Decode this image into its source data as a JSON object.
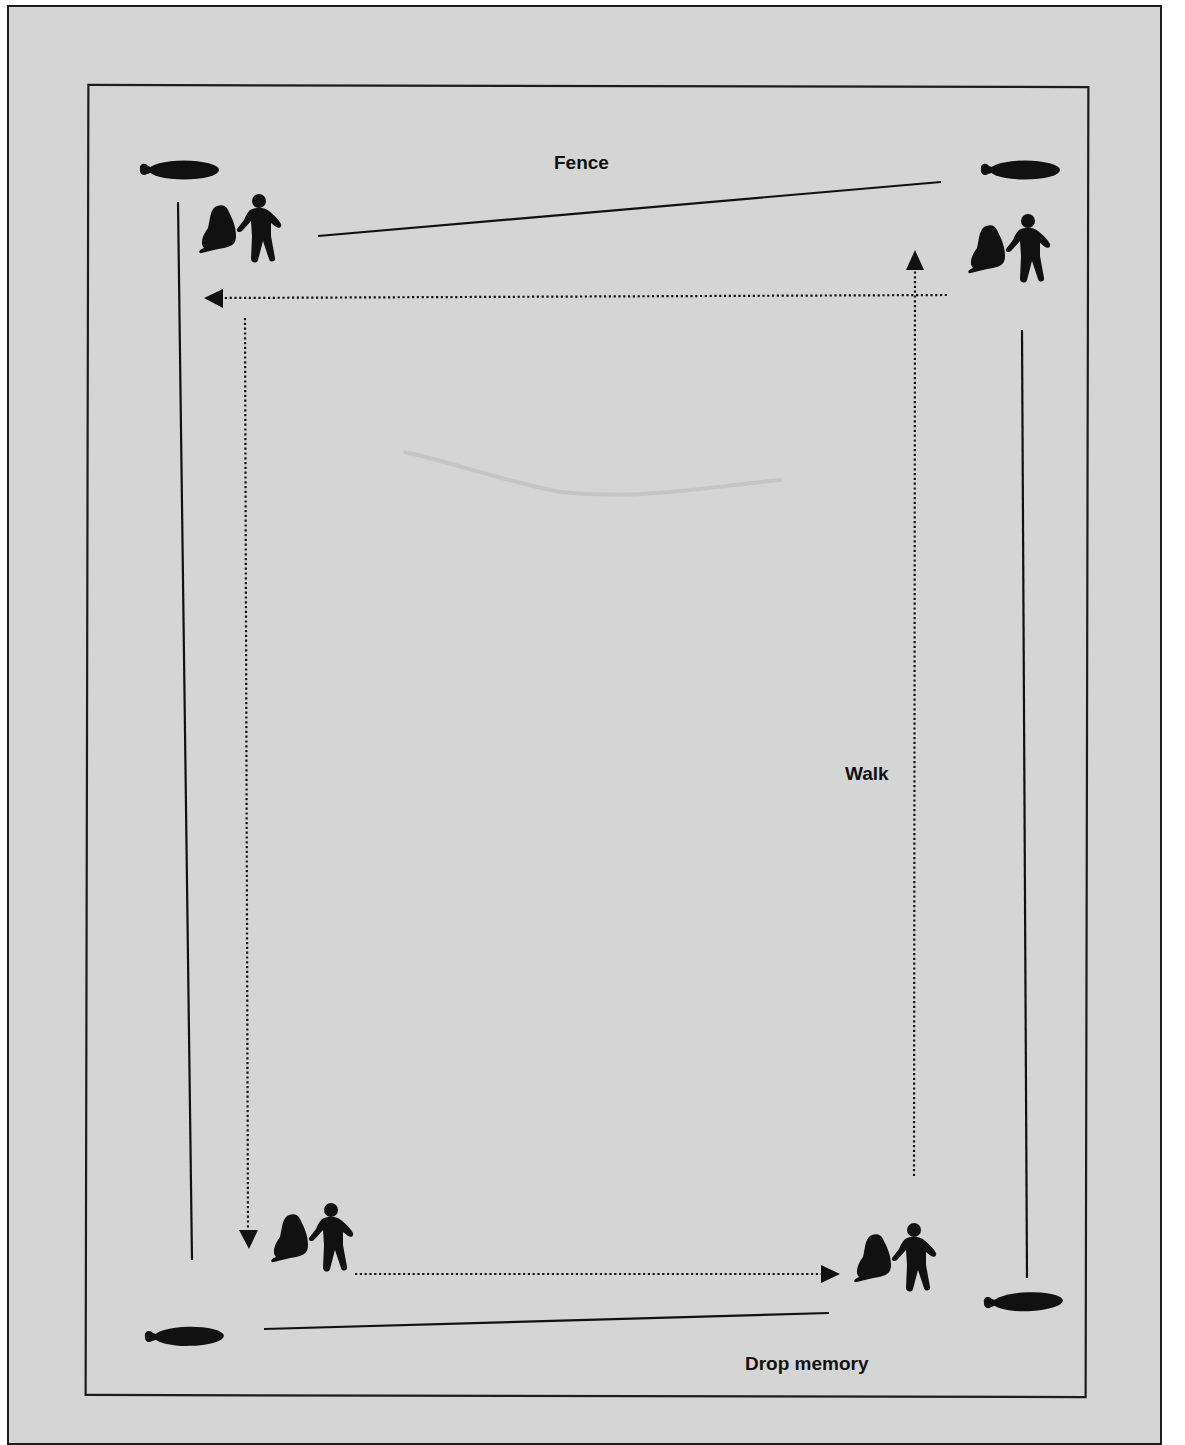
{
  "diagram": {
    "type": "fence-walk-path",
    "colors": {
      "page_background": "#ffffff",
      "paper": "#d5d5d5",
      "ink": "#111111",
      "faint_mark": "#b9b9b9"
    },
    "labels": {
      "fence": "Fence",
      "walk": "Walk",
      "drop_memory": "Drop memory"
    },
    "markers": [
      {
        "position": "top-left",
        "icon": "bone-marker-icon"
      },
      {
        "position": "top-right",
        "icon": "bone-marker-icon"
      },
      {
        "position": "bottom-left",
        "icon": "bone-marker-icon"
      },
      {
        "position": "bottom-right",
        "icon": "bone-marker-icon"
      }
    ],
    "figures": [
      {
        "position": "top-left",
        "icon": "person-with-dog-icon"
      },
      {
        "position": "top-right",
        "icon": "person-with-dog-icon"
      },
      {
        "position": "bottom-left",
        "icon": "person-with-dog-icon"
      },
      {
        "position": "bottom-right",
        "icon": "person-with-dog-icon"
      }
    ],
    "walk_path": [
      {
        "from": "bottom-left",
        "to": "bottom-right",
        "direction": "right"
      },
      {
        "from": "bottom-right",
        "to": "top-right",
        "direction": "up"
      },
      {
        "from": "top-right",
        "to": "top-left",
        "direction": "left"
      },
      {
        "from": "top-left",
        "to": "bottom-left",
        "direction": "down"
      }
    ]
  }
}
